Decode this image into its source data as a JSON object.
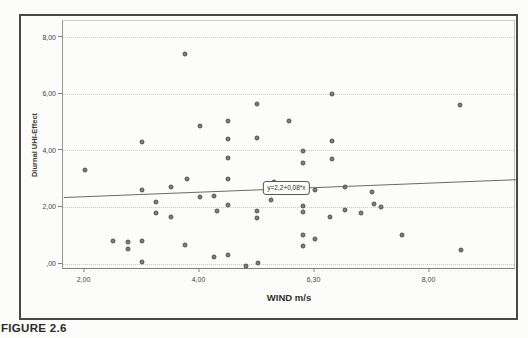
{
  "figure": {
    "caption": "FIGURE 2.6"
  },
  "chart_data": {
    "type": "scatter",
    "title": "",
    "xlabel": "WIND m/s",
    "ylabel": "Diurnal UHI-Effect",
    "x_ticks": [
      "2,00",
      "4,00",
      "6,30",
      "8,00"
    ],
    "x_tick_values": [
      2,
      4,
      6,
      8
    ],
    "y_ticks": [
      "8,00",
      "6,00",
      "4,00",
      "2,00",
      ",00"
    ],
    "y_tick_values": [
      8,
      6,
      4,
      2,
      0
    ],
    "xlim": [
      1.64,
      9.51
    ],
    "ylim": [
      -0.23,
      8.6
    ],
    "grid": "horizontal-dotted",
    "legend": "none",
    "marker": "filled-gray-circle",
    "regression": {
      "label": "y=2,2+0,08*x",
      "intercept": 2.2,
      "slope": 0.08,
      "annotation_x": 5.53,
      "annotation_y": 2.64
    },
    "points": [
      [
        2.0,
        3.3
      ],
      [
        2.5,
        0.8
      ],
      [
        2.75,
        0.77
      ],
      [
        2.75,
        0.5
      ],
      [
        3.0,
        4.28
      ],
      [
        3.0,
        2.6
      ],
      [
        3.0,
        0.78
      ],
      [
        3.0,
        0.05
      ],
      [
        3.25,
        2.16
      ],
      [
        3.25,
        1.78
      ],
      [
        3.5,
        2.7
      ],
      [
        3.5,
        1.66
      ],
      [
        3.75,
        7.4
      ],
      [
        3.78,
        3.0
      ],
      [
        3.75,
        0.65
      ],
      [
        4.0,
        4.87
      ],
      [
        4.0,
        2.36
      ],
      [
        4.25,
        2.4
      ],
      [
        4.3,
        1.87
      ],
      [
        4.25,
        0.22
      ],
      [
        4.5,
        5.02
      ],
      [
        4.5,
        4.4
      ],
      [
        4.5,
        3.73
      ],
      [
        4.5,
        3.0
      ],
      [
        4.5,
        2.05
      ],
      [
        4.5,
        0.3
      ],
      [
        4.8,
        -0.1
      ],
      [
        5.0,
        5.65
      ],
      [
        5.0,
        4.43
      ],
      [
        5.0,
        1.87
      ],
      [
        5.0,
        1.6
      ],
      [
        5.02,
        0.02
      ],
      [
        5.3,
        2.87
      ],
      [
        5.25,
        2.25
      ],
      [
        5.55,
        5.05
      ],
      [
        5.8,
        3.96
      ],
      [
        5.8,
        3.54
      ],
      [
        5.8,
        2.02
      ],
      [
        5.8,
        1.82
      ],
      [
        5.8,
        1.02
      ],
      [
        5.8,
        0.63
      ],
      [
        6.0,
        2.6
      ],
      [
        6.0,
        0.85
      ],
      [
        6.3,
        6.0
      ],
      [
        6.3,
        4.34
      ],
      [
        6.3,
        3.7
      ],
      [
        6.27,
        1.66
      ],
      [
        6.53,
        2.71
      ],
      [
        6.53,
        1.88
      ],
      [
        6.8,
        1.78
      ],
      [
        7.0,
        2.52
      ],
      [
        7.04,
        2.11
      ],
      [
        7.15,
        1.99
      ],
      [
        7.52,
        1.02
      ],
      [
        8.53,
        5.6
      ],
      [
        8.55,
        0.48
      ]
    ]
  }
}
